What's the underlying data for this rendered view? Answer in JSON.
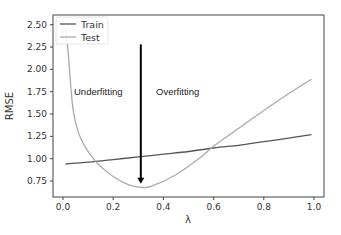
{
  "chart_data": {
    "type": "line",
    "title": "",
    "xlabel": "λ",
    "ylabel": "RMSE",
    "xlim": [
      -0.02,
      1.04
    ],
    "ylim": [
      0.57,
      2.6
    ],
    "xticks": [
      "0.0",
      "0.2",
      "0.4",
      "0.6",
      "0.8",
      "1.0"
    ],
    "yticks": [
      "0.75",
      "1.00",
      "1.25",
      "1.50",
      "1.75",
      "2.00",
      "2.25",
      "2.50"
    ],
    "grid": false,
    "legend_position": "upper left",
    "series": [
      {
        "name": "Train",
        "color": "#555555",
        "x": [
          0.01,
          0.1,
          0.2,
          0.3,
          0.4,
          0.5,
          0.6,
          0.7,
          0.8,
          0.9,
          0.99
        ],
        "y": [
          0.94,
          0.96,
          0.99,
          1.02,
          1.05,
          1.08,
          1.12,
          1.15,
          1.19,
          1.23,
          1.27
        ]
      },
      {
        "name": "Test",
        "color": "#aaaaaa",
        "x": [
          0.01,
          0.02,
          0.04,
          0.07,
          0.13,
          0.2,
          0.26,
          0.31,
          0.35,
          0.45,
          0.55,
          0.6,
          0.7,
          0.8,
          0.9,
          0.99
        ],
        "y": [
          2.46,
          2.21,
          1.56,
          1.23,
          0.97,
          0.8,
          0.71,
          0.68,
          0.69,
          0.82,
          1.02,
          1.14,
          1.34,
          1.54,
          1.73,
          1.89
        ]
      }
    ],
    "annotations": [
      {
        "text": "Underfitting",
        "x": 0.04,
        "y": 1.57
      },
      {
        "text": "Overfitting",
        "x": 0.37,
        "y": 1.57
      },
      {
        "type": "arrow",
        "x": 0.31,
        "y_start": 2.28,
        "y_end": 0.72,
        "color": "#000000"
      }
    ]
  },
  "legend": {
    "items": [
      {
        "label": "Train",
        "color": "#555555"
      },
      {
        "label": "Test",
        "color": "#aaaaaa"
      }
    ]
  }
}
